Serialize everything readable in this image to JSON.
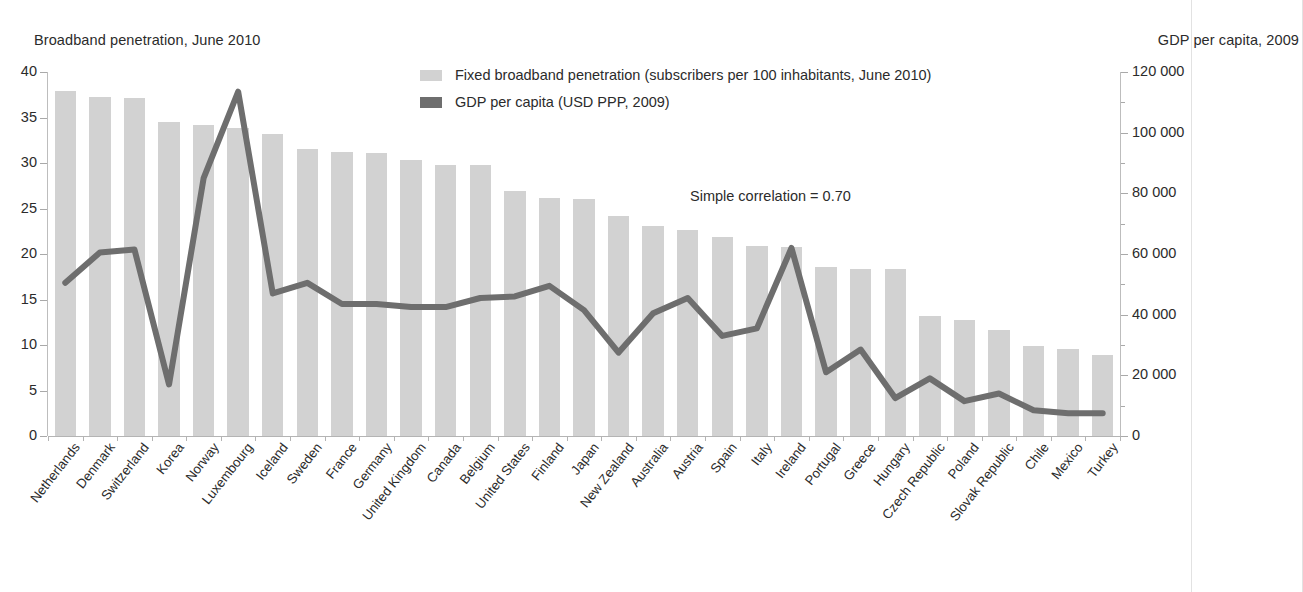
{
  "left_axis_title": "Broadband penetration, June 2010",
  "right_axis_title": "GDP per capita, 2009",
  "annotation": "Simple correlation = 0.70",
  "legend": [
    {
      "label": "Fixed broadband penetration (subscribers per 100 inhabitants, June 2010)",
      "color": "#d2d2d2",
      "type": "bar"
    },
    {
      "label": "GDP per capita (USD PPP, 2009)",
      "color": "#6e6e6e",
      "type": "line"
    }
  ],
  "colors": {
    "bar": "#d2d2d2",
    "line": "#6e6e6e",
    "text": "#2b2b2b",
    "axis": "#b4b4b4",
    "background": "#ffffff"
  },
  "chart_data": {
    "type": "bar",
    "title": "",
    "subtitle": "",
    "xlabel": "",
    "ylabel": "Broadband penetration, June 2010",
    "y2label": "GDP per capita, 2009",
    "ylim": [
      0,
      40
    ],
    "y2lim": [
      0,
      120000
    ],
    "yticks": [
      "0",
      "5",
      "10",
      "15",
      "20",
      "25",
      "30",
      "35",
      "40"
    ],
    "y2ticks": [
      "0",
      "20 000",
      "40 000",
      "60 000",
      "80 000",
      "100 000",
      "120 000"
    ],
    "grid": false,
    "legend_position": "top-center",
    "annotation": "Simple correlation = 0.70",
    "categories": [
      "Netherlands",
      "Denmark",
      "Switzerland",
      "Korea",
      "Norway",
      "Luxembourg",
      "Iceland",
      "Sweden",
      "France",
      "Germany",
      "United Kingdom",
      "Canada",
      "Belgium",
      "United States",
      "Finland",
      "Japan",
      "New Zealand",
      "Australia",
      "Austria",
      "Spain",
      "Italy",
      "Ireland",
      "Portugal",
      "Greece",
      "Hungary",
      "Czech Republic",
      "Poland",
      "Slovak Republic",
      "Chile",
      "Mexico",
      "Turkey"
    ],
    "series": [
      {
        "name": "Fixed broadband penetration (subscribers per 100 inhabitants, June 2010)",
        "type": "bar",
        "axis": "left",
        "color": "#d2d2d2",
        "values": [
          37.9,
          37.3,
          37.1,
          34.5,
          34.2,
          33.8,
          33.2,
          31.5,
          31.2,
          31.1,
          30.3,
          29.8,
          29.8,
          26.9,
          26.2,
          26.0,
          24.2,
          23.1,
          22.6,
          21.9,
          20.9,
          20.8,
          18.6,
          18.3,
          18.3,
          13.2,
          12.7,
          11.6,
          9.9,
          9.6,
          8.9
        ]
      },
      {
        "name": "GDP per capita (USD PPP, 2009)",
        "type": "line",
        "axis": "right",
        "color": "#6e6e6e",
        "values": [
          50500,
          60500,
          61500,
          17000,
          85000,
          113500,
          47000,
          50500,
          43500,
          43500,
          42500,
          42500,
          45500,
          46000,
          49500,
          41500,
          27500,
          40500,
          45500,
          33000,
          35500,
          62000,
          21000,
          28500,
          12500,
          19000,
          11500,
          14000,
          8500,
          7500,
          7500
        ]
      }
    ]
  }
}
